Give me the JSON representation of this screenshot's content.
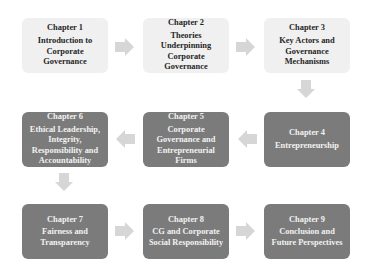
{
  "diagram": {
    "colors": {
      "light_box": "#f0f0f0",
      "dark_box": "#7b7b7b",
      "arrow": "#d6d6d6",
      "light_text": "#262626",
      "dark_text": "#f2f2f2"
    },
    "chapters": [
      {
        "number": "Chapter 1",
        "title": "Introduction to Corporate Governance"
      },
      {
        "number": "Chapter 2",
        "title": "Theories Underpinning Corporate Governance"
      },
      {
        "number": "Chapter 3",
        "title": "Key Actors and Governance Mechanisms"
      },
      {
        "number": "Chapter 4",
        "title": "Entrepreneurship"
      },
      {
        "number": "Chapter 5",
        "title": "Corporate Governance and Entrepreneurial Firms"
      },
      {
        "number": "Chapter 6",
        "title": "Ethical Leadership, Integrity, Responsibility and Accountability"
      },
      {
        "number": "Chapter 7",
        "title": "Fairness and Transparency"
      },
      {
        "number": "Chapter 8",
        "title": "CG and Corporate Social Responsibility"
      },
      {
        "number": "Chapter 9",
        "title": "Conclusion and Future Perspectives"
      }
    ],
    "flow": [
      "1→2",
      "2→3",
      "3↓4",
      "4←5",
      "5←6",
      "6↓7",
      "7→8",
      "8→9"
    ]
  }
}
